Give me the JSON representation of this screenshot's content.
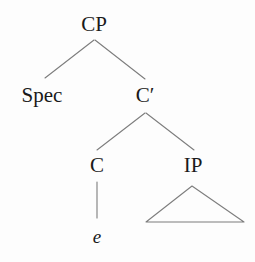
{
  "figure": {
    "type": "syntax-tree",
    "theory": "x-bar",
    "background_color": "#fdfdfd",
    "line_color": "#7d7d7d",
    "text_color": "#1a1a1a",
    "width": 255,
    "height": 262
  },
  "nodes": [
    {
      "id": "cp",
      "label": "CP",
      "x": 94,
      "y": 14,
      "level": 0,
      "kind": "phrase"
    },
    {
      "id": "spec",
      "label": "Spec",
      "x": 42,
      "y": 85,
      "level": 1,
      "kind": "specifier"
    },
    {
      "id": "cbar",
      "label": "C′",
      "x": 145,
      "y": 85,
      "level": 1,
      "kind": "bar"
    },
    {
      "id": "c",
      "label": "C",
      "x": 97,
      "y": 155,
      "level": 2,
      "kind": "head"
    },
    {
      "id": "ip",
      "label": "IP",
      "x": 193,
      "y": 155,
      "level": 2,
      "kind": "phrase"
    },
    {
      "id": "e",
      "label": "e",
      "x": 97,
      "y": 226,
      "level": 3,
      "kind": "empty-category",
      "italic": true
    }
  ],
  "edges": [
    {
      "id": "cp-spec",
      "from": "cp",
      "to": "spec",
      "x1": 94,
      "y1": 40,
      "x2": 45,
      "y2": 78
    },
    {
      "id": "cp-cbar",
      "from": "cp",
      "to": "cbar",
      "x1": 95,
      "y1": 40,
      "x2": 145,
      "y2": 79
    },
    {
      "id": "cbar-c",
      "from": "cbar",
      "to": "c",
      "x1": 145,
      "y1": 113,
      "x2": 97,
      "y2": 150
    },
    {
      "id": "cbar-ip",
      "from": "cbar",
      "to": "ip",
      "x1": 146,
      "y1": 113,
      "x2": 194,
      "y2": 150
    },
    {
      "id": "c-e",
      "from": "c",
      "to": "e",
      "x1": 97,
      "y1": 182,
      "x2": 97,
      "y2": 218
    }
  ],
  "triangles": [
    {
      "id": "ip-triangle",
      "under": "ip",
      "apex_x": 192,
      "apex_y": 186,
      "base_left_x": 146,
      "base_right_x": 244,
      "base_y": 222
    }
  ]
}
